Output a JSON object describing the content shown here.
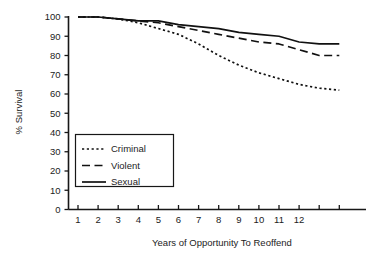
{
  "chart_data": {
    "type": "line",
    "title": "",
    "xlabel": "Years of Opportunity To Reoffend",
    "ylabel": "% Survival",
    "xlim": [
      1,
      14
    ],
    "ylim": [
      0,
      100
    ],
    "grid": false,
    "legend_position": "center-left",
    "x": [
      1,
      2,
      3,
      4,
      5,
      6,
      7,
      8,
      9,
      10,
      11,
      12,
      13,
      14
    ],
    "xticks": [
      1,
      2,
      3,
      4,
      5,
      6,
      7,
      8,
      9,
      10,
      11,
      12,
      13,
      14
    ],
    "xtick_labels": [
      "1",
      "2",
      "3",
      "4",
      "5",
      "6",
      "7",
      "8",
      "9",
      "10",
      "11",
      "12",
      "",
      ""
    ],
    "yticks": [
      0,
      10,
      20,
      30,
      40,
      50,
      60,
      70,
      80,
      90,
      100
    ],
    "ytick_labels": [
      "0",
      "10",
      "20",
      "30",
      "40",
      "50",
      "60",
      "70",
      "80",
      "90",
      "100"
    ],
    "series": [
      {
        "name": "Criminal",
        "style": "dotted",
        "values": [
          100,
          100,
          99,
          97,
          94,
          91,
          86,
          80,
          75,
          71,
          68,
          65,
          63,
          62
        ]
      },
      {
        "name": "Violent",
        "style": "dashed",
        "values": [
          100,
          100,
          99,
          98,
          97,
          95,
          93,
          91,
          89,
          87,
          86,
          83,
          80,
          80
        ]
      },
      {
        "name": "Sexual",
        "style": "solid",
        "values": [
          100,
          100,
          99,
          98,
          98,
          96,
          95,
          94,
          92,
          91,
          90,
          87,
          86,
          86
        ]
      }
    ]
  },
  "legend": {
    "items": [
      {
        "label": "Criminal",
        "style": "dotted"
      },
      {
        "label": "Violent",
        "style": "dashed"
      },
      {
        "label": "Sexual",
        "style": "solid"
      }
    ]
  },
  "colors": {
    "ink": "#111111",
    "background": "#ffffff"
  }
}
